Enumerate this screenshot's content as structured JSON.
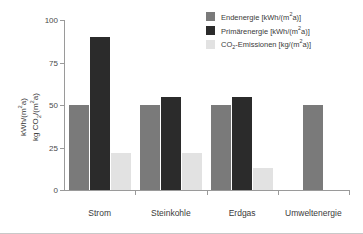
{
  "chart_data": {
    "type": "bar",
    "title": "",
    "xlabel": "",
    "ylabel_line1": "kWh/(m²a)",
    "ylabel_line2": "kg CO₂/(m²a)",
    "categories": [
      "Strom",
      "Steinkohle",
      "Erdgas",
      "Umweltenergie"
    ],
    "ylim": [
      0,
      100
    ],
    "yticks": [
      0,
      25,
      50,
      75,
      100
    ],
    "ytick_labels": [
      "0",
      "25",
      "50",
      "75",
      "100"
    ],
    "grid": false,
    "legend_position": "top-right",
    "series": [
      {
        "name": "Endenergie [kWh/(m²a)]",
        "color": "#7a7a7a",
        "values": [
          50,
          50,
          50,
          50
        ]
      },
      {
        "name": "Primärenergie [kWh/(m²a)]",
        "color": "#2b2b2b",
        "values": [
          90,
          55,
          55,
          null
        ]
      },
      {
        "name": "CO₂-Emissionen [kg/(m²a)]",
        "color": "#e2e2e2",
        "values": [
          22,
          22,
          13,
          null
        ]
      }
    ]
  },
  "legend": {
    "items": [
      {
        "label": "Endenergie [kWh/(m²a)]",
        "color": "#7a7a7a"
      },
      {
        "label": "Primärenergie [kWh/(m²a)]",
        "color": "#2b2b2b"
      },
      {
        "label": "CO₂-Emissionen [kg/(m²a)]",
        "color": "#e2e2e2"
      }
    ]
  },
  "axis": {
    "y_title_line1": "kWh/(m²a)",
    "y_title_line2": "kg CO₂/(m²a)"
  }
}
